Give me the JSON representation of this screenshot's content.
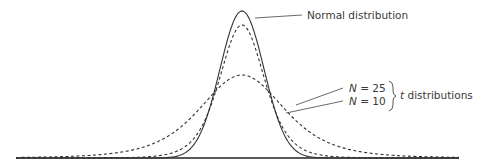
{
  "diagram": {
    "labels": {
      "normal": "Normal distribution",
      "n25_var": "N",
      "n25_rest": " = 25",
      "n10_var": "N",
      "n10_rest": " = 10",
      "group_var": "t",
      "group_rest": " distributions"
    },
    "curves": [
      {
        "name": "Normal distribution",
        "style": "solid",
        "relative_peak_height": 1.0
      },
      {
        "name": "t distribution, N = 25",
        "style": "dashed",
        "relative_peak_height_as_drawn": 0.9
      },
      {
        "name": "t distribution, N = 10",
        "style": "dashed",
        "relative_peak_height_as_drawn": 0.57
      }
    ],
    "note": "Schematic figure: the dashed curves are drawn much flatter and wider than true t distributions with N = 25 or N = 10 (which would peak at roughly 0.97-0.98 of the normal's height). The shapes here are fitted to the pixels, not computed from the stated N; the image shows no axis scale or degrees of freedom.",
    "colors": {
      "curve": "#333333",
      "baseline": "#222222",
      "text": "#3a3a3a"
    }
  }
}
